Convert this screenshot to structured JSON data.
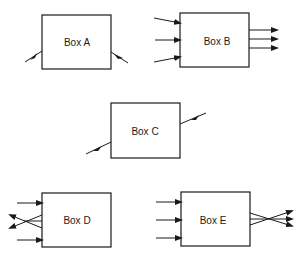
{
  "diagram": {
    "type": "block-flow-examples",
    "boxes": [
      {
        "id": "A",
        "label": "Box A",
        "inputs": 1,
        "outputs": 1,
        "description": "single diagonal input, single diagonal output"
      },
      {
        "id": "B",
        "label": "Box B",
        "inputs": 3,
        "outputs": 3,
        "description": "three inputs, three parallel outputs"
      },
      {
        "id": "C",
        "label": "Box C",
        "inputs": 1,
        "outputs": 1,
        "description": "single diagonal input and output on one line"
      },
      {
        "id": "D",
        "label": "Box D",
        "inputs": 2,
        "outputs": 2,
        "description": "two inputs, two crossing lines exiting on the left"
      },
      {
        "id": "E",
        "label": "Box E",
        "inputs": 3,
        "outputs": 3,
        "description": "three inputs, three converging/crossing outputs"
      }
    ],
    "colors": {
      "stroke": "#1a1a1a",
      "background": "#ffffff"
    }
  }
}
